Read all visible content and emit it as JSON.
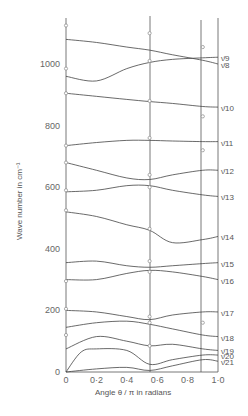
{
  "figure": {
    "header_text": "",
    "ylabel": "Wave number in cm⁻¹",
    "xlabel": "Angle θ / π in radians"
  },
  "chart_data": {
    "type": "line",
    "title": "",
    "xlabel": "Angle θ/π in radians",
    "ylabel": "Wave number in cm⁻¹",
    "xlim": [
      0,
      1.0
    ],
    "ylim": [
      0,
      1150
    ],
    "x_ticks": [
      "0",
      "0·2",
      "0·4",
      "0·6",
      "0·8",
      "1·0"
    ],
    "y_ticks": [
      "0",
      "200",
      "400",
      "600",
      "800",
      "1000"
    ],
    "vertical_reference_lines_x": [
      0,
      0.55,
      0.9,
      1.0
    ],
    "grid": false,
    "legend": "curve labels at right edge",
    "series": [
      {
        "name": "ν̄ 8",
        "x": [
          0,
          0.2,
          0.4,
          0.55,
          0.7,
          0.9,
          1.0
        ],
        "values": [
          1080,
          1070,
          1055,
          1045,
          1030,
          1012,
          1000
        ]
      },
      {
        "name": "ν̄ 9",
        "x": [
          0,
          0.2,
          0.4,
          0.55,
          0.7,
          0.9,
          1.0
        ],
        "values": [
          960,
          945,
          985,
          1005,
          1015,
          1020,
          1022
        ]
      },
      {
        "name": "ν̄ 10",
        "x": [
          0,
          0.2,
          0.4,
          0.55,
          0.7,
          0.9,
          1.0
        ],
        "values": [
          905,
          895,
          885,
          878,
          872,
          862,
          860
        ]
      },
      {
        "name": "ν̄ 11",
        "x": [
          0,
          0.2,
          0.4,
          0.55,
          0.7,
          0.9,
          1.0
        ],
        "values": [
          735,
          745,
          752,
          752,
          750,
          748,
          748
        ]
      },
      {
        "name": "ν̄ 12",
        "x": [
          0,
          0.2,
          0.4,
          0.55,
          0.7,
          0.9,
          1.0
        ],
        "values": [
          680,
          655,
          630,
          625,
          640,
          655,
          655
        ]
      },
      {
        "name": "ν̄ 13",
        "x": [
          0,
          0.2,
          0.4,
          0.55,
          0.7,
          0.9,
          1.0
        ],
        "values": [
          585,
          590,
          605,
          605,
          590,
          575,
          570
        ]
      },
      {
        "name": "ν̄ 14",
        "x": [
          0,
          0.2,
          0.4,
          0.55,
          0.7,
          0.9,
          1.0
        ],
        "values": [
          520,
          505,
          478,
          460,
          420,
          430,
          440
        ]
      },
      {
        "name": "ν̄ 15",
        "x": [
          0,
          0.2,
          0.4,
          0.55,
          0.7,
          0.9,
          1.0
        ],
        "values": [
          355,
          360,
          345,
          340,
          345,
          352,
          355
        ]
      },
      {
        "name": "ν̄ 16",
        "x": [
          0,
          0.2,
          0.4,
          0.55,
          0.7,
          0.9,
          1.0
        ],
        "values": [
          300,
          300,
          320,
          330,
          325,
          310,
          300
        ]
      },
      {
        "name": "ν̄ 17",
        "x": [
          0,
          0.2,
          0.4,
          0.55,
          0.7,
          0.9,
          1.0
        ],
        "values": [
          200,
          195,
          180,
          170,
          185,
          195,
          195
        ]
      },
      {
        "name": "ν̄ 18",
        "x": [
          0,
          0.2,
          0.4,
          0.55,
          0.7,
          0.9,
          1.0
        ],
        "values": [
          145,
          160,
          165,
          155,
          140,
          120,
          115
        ]
      },
      {
        "name": "ν̄ 19",
        "x": [
          0,
          0.2,
          0.4,
          0.55,
          0.7,
          0.9,
          1.0
        ],
        "values": [
          75,
          115,
          100,
          85,
          90,
          75,
          70
        ]
      },
      {
        "name": "ν̄ 20",
        "x": [
          0,
          0.1,
          0.2,
          0.4,
          0.55,
          0.7,
          0.9,
          1.0
        ],
        "values": [
          0,
          65,
          75,
          70,
          25,
          40,
          55,
          55
        ]
      },
      {
        "name": "ν̄ 21",
        "x": [
          0,
          0.2,
          0.4,
          0.55,
          0.7,
          0.9,
          1.0
        ],
        "values": [
          0,
          10,
          15,
          5,
          20,
          40,
          35
        ]
      }
    ],
    "observed_points": [
      {
        "x": 0,
        "y": 1125
      },
      {
        "x": 0,
        "y": 985
      },
      {
        "x": 0,
        "y": 905
      },
      {
        "x": 0,
        "y": 735
      },
      {
        "x": 0,
        "y": 680
      },
      {
        "x": 0,
        "y": 590
      },
      {
        "x": 0,
        "y": 525
      },
      {
        "x": 0,
        "y": 295
      },
      {
        "x": 0,
        "y": 205
      },
      {
        "x": 0,
        "y": 120
      },
      {
        "x": 0.55,
        "y": 1100
      },
      {
        "x": 0.55,
        "y": 1010
      },
      {
        "x": 0.55,
        "y": 880
      },
      {
        "x": 0.55,
        "y": 760
      },
      {
        "x": 0.55,
        "y": 640
      },
      {
        "x": 0.55,
        "y": 600
      },
      {
        "x": 0.55,
        "y": 465
      },
      {
        "x": 0.55,
        "y": 360
      },
      {
        "x": 0.55,
        "y": 325
      },
      {
        "x": 0.55,
        "y": 180
      },
      {
        "x": 0.55,
        "y": 160
      },
      {
        "x": 0.55,
        "y": 85
      },
      {
        "x": 0.9,
        "y": 1055
      },
      {
        "x": 0.9,
        "y": 830
      },
      {
        "x": 0.9,
        "y": 720
      },
      {
        "x": 0.9,
        "y": 160
      }
    ]
  }
}
